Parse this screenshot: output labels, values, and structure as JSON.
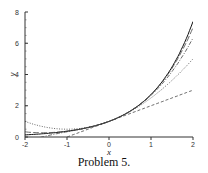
{
  "caption": "Problem 5.",
  "chart_data": {
    "type": "line",
    "title": "",
    "xlabel": "x",
    "ylabel": "y",
    "xlim": [
      -2,
      2
    ],
    "ylim": [
      0,
      8
    ],
    "xticks": [
      -2,
      -1,
      0,
      1,
      2
    ],
    "yticks": [
      0,
      2,
      4,
      6,
      8
    ],
    "grid": false,
    "legend": "none",
    "series": [
      {
        "name": "e^x",
        "style": "solid",
        "x": [
          -2,
          -1.5,
          -1,
          -0.5,
          0,
          0.5,
          1,
          1.5,
          2
        ],
        "values": [
          0.14,
          0.22,
          0.37,
          0.61,
          1,
          1.65,
          2.72,
          4.48,
          7.39
        ]
      },
      {
        "name": "1+x",
        "style": "dashed",
        "x": [
          -1,
          -0.5,
          0,
          0.5,
          1,
          1.5,
          2
        ],
        "values": [
          0,
          0.5,
          1,
          1.5,
          2,
          2.5,
          3
        ]
      },
      {
        "name": "1+x+x^2/2",
        "style": "dotted",
        "x": [
          -2,
          -1.5,
          -1,
          -0.5,
          0,
          0.5,
          1,
          1.5,
          2
        ],
        "values": [
          1,
          0.63,
          0.5,
          0.63,
          1,
          1.63,
          2.5,
          3.63,
          5
        ]
      },
      {
        "name": "1+x+x^2/2+x^3/6",
        "style": "dashdot",
        "x": [
          -2,
          -1.5,
          -1,
          -0.5,
          0,
          0.5,
          1,
          1.5,
          2
        ],
        "values": [
          -0.33,
          0.06,
          0.33,
          0.6,
          1,
          1.65,
          2.67,
          4.19,
          6.33
        ]
      },
      {
        "name": "1+x+x^2/2+x^3/6+x^4/24",
        "style": "longdash",
        "x": [
          -2,
          -1.5,
          -1,
          -0.5,
          0,
          0.5,
          1,
          1.5,
          2
        ],
        "values": [
          0.33,
          0.27,
          0.38,
          0.6,
          1,
          1.65,
          2.71,
          4.4,
          7.0
        ]
      }
    ]
  }
}
